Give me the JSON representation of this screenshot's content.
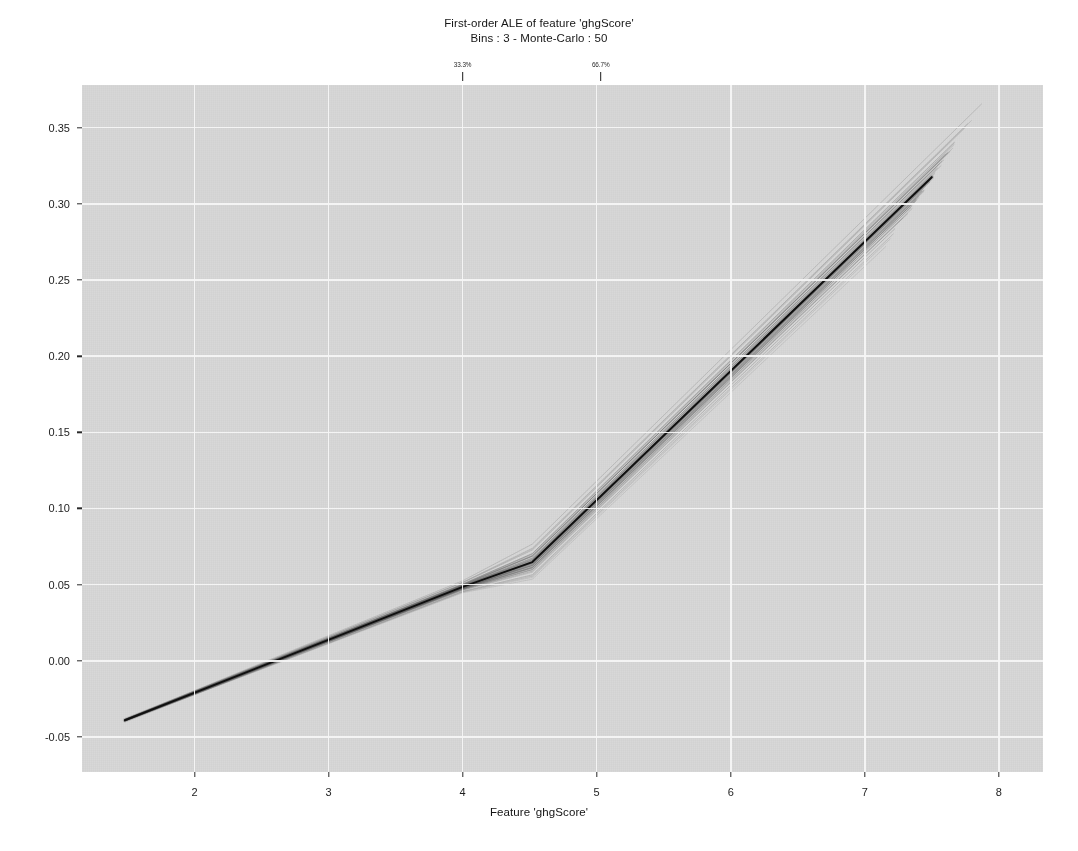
{
  "figure": {
    "title_line_1": "First-order ALE of feature 'ghgScore'",
    "title_line_2": "Bins : 3 - Monte-Carlo : 50",
    "background_color": "#ffffff",
    "panel_color": "#d8d8d8",
    "grid_color": "#f5f5f5",
    "main_line_color": "#101010",
    "mc_line_color": "#6f6f6f"
  },
  "bin_markers": [
    {
      "label": "33.3%",
      "x": 4.0
    },
    {
      "label": "66.7%",
      "x": 5.03
    }
  ],
  "chart_data": {
    "type": "line",
    "title": "First-order ALE of feature 'ghgScore'",
    "subtitle": "Bins : 3 - Monte-Carlo : 50",
    "xlabel": "Feature 'ghgScore'",
    "ylabel": "",
    "xlim": [
      1.16,
      8.33
    ],
    "ylim": [
      -0.073,
      0.378
    ],
    "xticks": [
      2,
      3,
      4,
      5,
      6,
      7,
      8
    ],
    "xtick_labels": [
      "2",
      "3",
      "4",
      "5",
      "6",
      "7",
      "8"
    ],
    "yticks": [
      -0.05,
      0.0,
      0.05,
      0.1,
      0.15,
      0.2,
      0.25,
      0.3,
      0.35
    ],
    "ytick_labels": [
      "-0.05",
      "0.00",
      "0.05",
      "0.10",
      "0.15",
      "0.20",
      "0.25",
      "0.30",
      "0.35"
    ],
    "grid": true,
    "legend": "none",
    "bins": 3,
    "monte_carlo_replicates": 50,
    "quantile_breaks": [
      4.0,
      5.03
    ],
    "series": [
      {
        "name": "ALE (main)",
        "kind": "main",
        "color": "#101010",
        "width": 2.0,
        "x": [
          1.48,
          4.0,
          4.52,
          7.5
        ],
        "y": [
          -0.039,
          0.0485,
          0.0648,
          0.3175
        ]
      },
      {
        "name": "Monte-Carlo replicates",
        "kind": "mc",
        "color": "#6f6f6f",
        "count": 50,
        "x": [
          1.48,
          4.0,
          4.52,
          7.5
        ],
        "y_mean": [
          -0.039,
          0.0485,
          0.0648,
          0.3175
        ],
        "y_spread_low": [
          -0.0425,
          0.0425,
          0.0505,
          0.2795
        ],
        "y_spread_high": [
          -0.0355,
          0.0545,
          0.0745,
          0.3575
        ],
        "end_x_jitter": [
          7.25,
          8.02
        ]
      }
    ],
    "annotations": [
      {
        "text": "33.3%",
        "x": 4.0,
        "position": "above-axis"
      },
      {
        "text": "66.7%",
        "x": 5.03,
        "position": "above-axis"
      }
    ]
  },
  "axis": {
    "x_axis_label": "Feature 'ghgScore'"
  }
}
